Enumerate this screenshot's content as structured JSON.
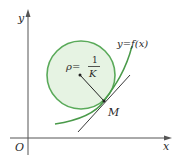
{
  "diagram": {
    "axes": {
      "x_label": "x",
      "y_label": "y",
      "origin_label": "O"
    },
    "curve_label": "y=f(x)",
    "point_label": "M",
    "radius_label": {
      "lhs": "ρ=",
      "numerator": "1",
      "denominator": "K"
    },
    "colors": {
      "circle_stroke": "#5aaa5a",
      "circle_fill": "#e6f3e3",
      "curve": "#4a9a4a",
      "axes": "#555555",
      "tangent": "#222222"
    }
  }
}
